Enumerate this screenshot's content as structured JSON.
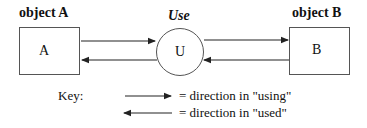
{
  "diagram": {
    "object_a": {
      "title": "object A",
      "label": "A"
    },
    "use": {
      "title": "Use",
      "label": "U"
    },
    "object_b": {
      "title": "object B",
      "label": "B"
    },
    "key": {
      "label": "Key:",
      "items": [
        {
          "direction": "right",
          "text": "= direction in \"using\""
        },
        {
          "direction": "left",
          "text": "= direction in \"used\""
        }
      ]
    },
    "colors": {
      "line": "#222222",
      "border": "#555555"
    }
  }
}
